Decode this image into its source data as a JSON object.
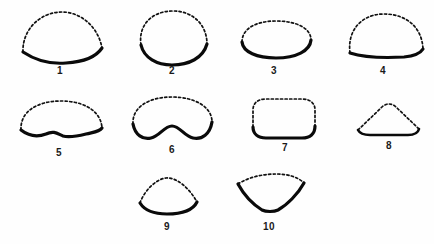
{
  "plate": {
    "title": "Shape outline plate",
    "description": "Ten shape outlines, each drawn with a dashed upper margin and a bold solid lower margin.",
    "background_color": "#fefefe",
    "dashed_stroke_color": "#111111",
    "solid_stroke_color": "#0a0a0a",
    "figure_count": 10
  },
  "figures": [
    {
      "label": "1",
      "name": "dome-with-concave-base",
      "dashed_part": "upper arch",
      "solid_part": "shallow concave base"
    },
    {
      "label": "2",
      "name": "rounded-ovate-with-deep-concave-base",
      "dashed_part": "upper oval arc",
      "solid_part": "deep U-shaped base"
    },
    {
      "label": "3",
      "name": "flat-ellipse",
      "dashed_part": "upper ellipse arc",
      "solid_part": "lower ellipse arc"
    },
    {
      "label": "4",
      "name": "broad-arch-with-flat-base",
      "dashed_part": "broad rounded arch",
      "solid_part": "flat base"
    },
    {
      "label": "5",
      "name": "dome-with-shallow-wavy-base",
      "dashed_part": "low broad dome",
      "solid_part": "shallow wavy base"
    },
    {
      "label": "6",
      "name": "bean-with-deep-wavy-base",
      "dashed_part": "rounded dome",
      "solid_part": "deep W-shaped wavy base"
    },
    {
      "label": "7",
      "name": "rounded-rectangle",
      "dashed_part": "top and upper sides",
      "solid_part": "flat base and lower corners"
    },
    {
      "label": "8",
      "name": "rounded-triangle",
      "dashed_part": "two upper sloping sides",
      "solid_part": "flat base"
    },
    {
      "label": "9",
      "name": "triangular-dome-with-curved-base",
      "dashed_part": "pointed rounded apex",
      "solid_part": "gently curved base"
    },
    {
      "label": "10",
      "name": "inverted-fan-wedge",
      "dashed_part": "convex upper arc",
      "solid_part": "V-shaped converging sides"
    }
  ]
}
